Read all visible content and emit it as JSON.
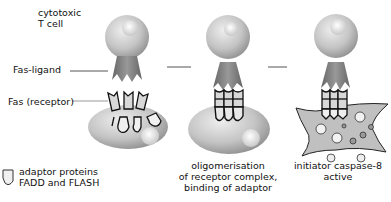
{
  "labels": {
    "tcell_line1": "cytotoxic",
    "tcell_line2": "T cell",
    "fas_ligand": "Fas-ligand",
    "fas_receptor": "Fas (receptor)",
    "legend_line1": "adaptor proteins",
    "legend_line2": "FADD and FLASH"
  },
  "captions": {
    "stage2_line1": "oligomerisation",
    "stage2_line2": "of receptor complex,",
    "stage2_line3": "binding of adaptor",
    "stage3_line1": "initiator caspase-8",
    "stage3_line2": "active"
  },
  "colors": {
    "cell_fill": "#c8c8c8",
    "cell_dark": "#8a8a8a",
    "ligand": "#777777",
    "receptor_fill": "#d4d4d4",
    "outline": "#111111"
  }
}
